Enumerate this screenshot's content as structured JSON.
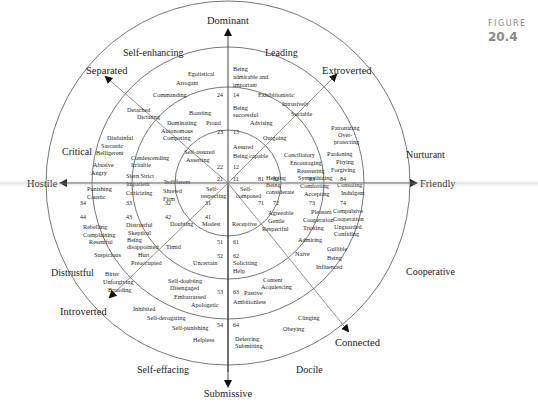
{
  "figure": {
    "label": "FIGURE",
    "number": "20.4"
  },
  "axes": {
    "top": "Dominant",
    "bottom": "Submissive",
    "left": "Hostile",
    "right": "Friendly",
    "upper_left": "Separated",
    "upper_right": "Extroverted",
    "lower_left": "Introverted",
    "lower_right": "Connected"
  },
  "octants": {
    "self_enhancing": "Self-enhancing",
    "leading": "Leading",
    "critical": "Critical",
    "nurturant": "Nurturant",
    "distrustful": "Distrustful",
    "cooperative": "Cooperative",
    "self_effacing": "Self-effacing",
    "docile": "Docile"
  },
  "numbers": {
    "n11": "11",
    "n12": "12",
    "n13": "13",
    "n14": "14",
    "n21": "21",
    "n22": "22",
    "n23": "23",
    "n24": "24",
    "n31": "31",
    "n32": "32",
    "n33": "33",
    "n34": "34",
    "n41": "41",
    "n42": "42",
    "n43": "43",
    "n44": "44",
    "n51": "51",
    "n52": "52",
    "n53": "53",
    "n54": "54",
    "n61": "61",
    "n62": "62",
    "n63": "63",
    "n64": "64",
    "n71": "71",
    "n72": "72",
    "n73": "73",
    "n74": "74",
    "n81": "81",
    "n82": "82",
    "n83": "83",
    "n84": "84"
  },
  "items": {
    "o14": [
      "Being",
      "admirable and",
      "important",
      "Exhibitionistic",
      "Intrusively",
      "Sociable"
    ],
    "o13": [
      "Being",
      "successful",
      "Advising",
      "Outgoing"
    ],
    "o12": [
      "Assured",
      "Being capable"
    ],
    "o11": [
      "Self-",
      "composed"
    ],
    "o24": [
      "Egotistical",
      "Arrogant",
      "Commanding",
      "Detached",
      "Dictating"
    ],
    "o23": [
      "Boasting",
      "Proud",
      "Dominating",
      "Autonomous",
      "Competing"
    ],
    "o22": [
      "Self-assured",
      "Asserting"
    ],
    "o21": [
      "Self-",
      "respecting"
    ],
    "o34": [
      "Disdainful",
      "Sarcastic",
      "Belligerent",
      "Abusive",
      "Angry",
      "Punishing",
      "Caustic"
    ],
    "o33": [
      "Condescending",
      "Irritable",
      "Stern  Strict",
      "Impatient",
      "Criticizing"
    ],
    "o32": [
      "Indifferent",
      "Shrewd",
      "Firm"
    ],
    "o44": [
      "Rebelling",
      "Complaining",
      "Resentful",
      "Suspicious",
      "Bitter",
      "Unforgiving",
      "Brooding"
    ],
    "o43": [
      "Distrustful",
      "Skeptical",
      "Being",
      "disappointed",
      "Hurt",
      "Preoccupied"
    ],
    "o42": [
      "Doubting",
      "Timid"
    ],
    "o41": [
      "Modest"
    ],
    "o54": [
      "Inhibited",
      "Self-derogating",
      "Self-punishing",
      "Helpless"
    ],
    "o53": [
      "Self-doubting",
      "Disengaged",
      "Embarrassed",
      "Apologetic"
    ],
    "o52": [
      "Uncertain"
    ],
    "o64": [
      "Deferring",
      "Submitting",
      "Clinging",
      "Obeying"
    ],
    "o63": [
      "Passive",
      "Ambitionless",
      "Content",
      "Acquiescing"
    ],
    "o62": [
      "Soliciting",
      "Help"
    ],
    "o61": [
      "Receptive"
    ],
    "o74": [
      "Compulsive",
      "Cooperation",
      "Unguarded",
      "Confiding",
      "Gullible",
      "Being",
      "Influenced"
    ],
    "o73": [
      "Pleasant",
      "Cooperation",
      "Trusting",
      "Admiring",
      "Naive"
    ],
    "o72": [
      "Agreeable",
      "Gentle",
      "Respectful"
    ],
    "o84": [
      "Patronizing",
      "Over-",
      "protecting",
      "Pardoning",
      "Pitying",
      "Forgiving",
      "Consoling",
      "Indulgent"
    ],
    "o83": [
      "Conciliatory",
      "Encouraging",
      "Reassuring",
      "Sympathizing",
      "Comforting",
      "Accepting"
    ],
    "o82": [
      "Helping",
      "Being",
      "considerate"
    ]
  }
}
